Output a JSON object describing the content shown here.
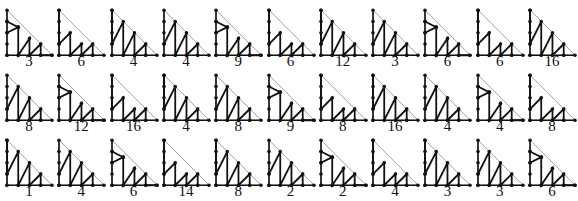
{
  "diagram": {
    "colors": {
      "stroke": "#111111",
      "outline": "#888888",
      "dot": "#111111",
      "background": "#ffffff"
    },
    "grid": {
      "columns": 11,
      "rows": 3,
      "lattice_size": 4
    },
    "rows": [
      {
        "labels": [
          "3",
          "6",
          "4",
          "4",
          "9",
          "6",
          "12",
          "3",
          "6",
          "6",
          "16"
        ]
      },
      {
        "labels": [
          "8",
          "12",
          "16",
          "4",
          "8",
          "9",
          "8",
          "16",
          "4",
          "4",
          "8"
        ]
      },
      {
        "labels": [
          "1",
          "4",
          "6",
          "14",
          "8",
          "2",
          "2",
          "4",
          "3",
          "3",
          "6"
        ]
      }
    ]
  }
}
